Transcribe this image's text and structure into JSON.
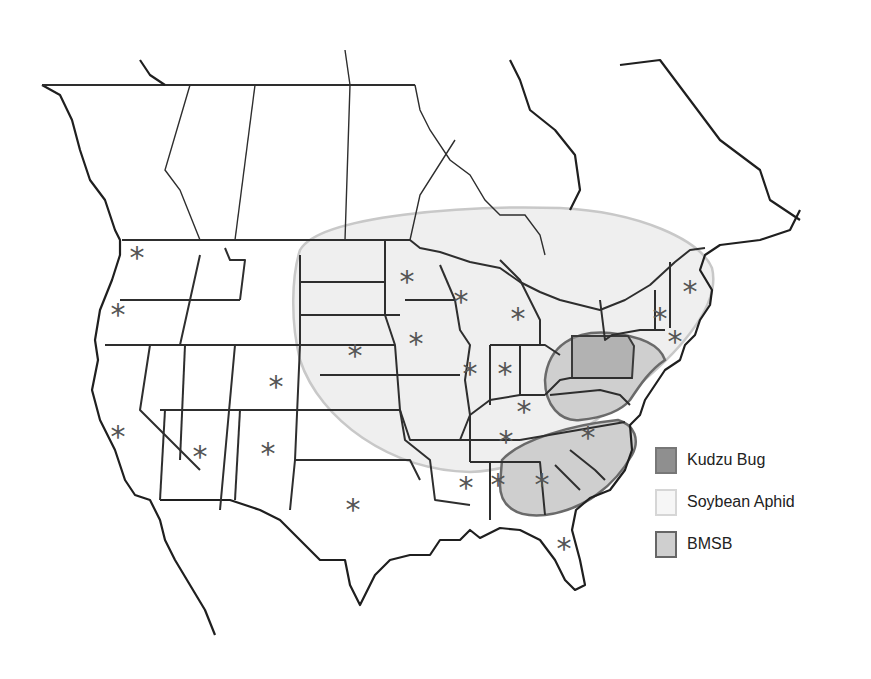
{
  "map": {
    "title": "",
    "region": "Continental United States and southern Canada",
    "colors": {
      "background": "#ffffff",
      "land": "#ffffff",
      "border": "#2e2e2e",
      "kudzu_bug": "#9a9a9a",
      "soybean_aphid": "#efefef",
      "soybean_aphid_outline": "#c8c8c8",
      "bmsb": "#cfcfcf",
      "bmsb_outline": "#6a6a6a",
      "asterisk": "#555555"
    },
    "marker_symbol": "*",
    "markers": [
      {
        "state": "Washington",
        "x": 137,
        "y": 256
      },
      {
        "state": "Oregon",
        "x": 118,
        "y": 313
      },
      {
        "state": "California",
        "x": 118,
        "y": 435
      },
      {
        "state": "Colorado",
        "x": 276,
        "y": 385
      },
      {
        "state": "Arizona",
        "x": 200,
        "y": 455
      },
      {
        "state": "New Mexico",
        "x": 268,
        "y": 452
      },
      {
        "state": "Texas",
        "x": 353,
        "y": 508
      },
      {
        "state": "Minnesota",
        "x": 407,
        "y": 280
      },
      {
        "state": "Nebraska",
        "x": 355,
        "y": 354
      },
      {
        "state": "Iowa",
        "x": 416,
        "y": 342
      },
      {
        "state": "Wisconsin",
        "x": 461,
        "y": 300
      },
      {
        "state": "Michigan",
        "x": 518,
        "y": 317
      },
      {
        "state": "Illinois",
        "x": 470,
        "y": 372
      },
      {
        "state": "Indiana",
        "x": 505,
        "y": 372
      },
      {
        "state": "Kentucky",
        "x": 524,
        "y": 410
      },
      {
        "state": "Tennessee",
        "x": 506,
        "y": 440
      },
      {
        "state": "Mississippi",
        "x": 466,
        "y": 486
      },
      {
        "state": "Alabama",
        "x": 498,
        "y": 483
      },
      {
        "state": "Georgia",
        "x": 542,
        "y": 483
      },
      {
        "state": "North Carolina",
        "x": 588,
        "y": 436
      },
      {
        "state": "Florida",
        "x": 564,
        "y": 547
      },
      {
        "state": "Vermont / New Hampshire",
        "x": 660,
        "y": 317
      },
      {
        "state": "Maine",
        "x": 690,
        "y": 290
      },
      {
        "state": "Connecticut / Rhode Island",
        "x": 675,
        "y": 340
      }
    ]
  },
  "legend": {
    "items": [
      {
        "label": "Kudzu Bug",
        "swatch": "kudzu_bug"
      },
      {
        "label": "Soybean Aphid",
        "swatch": "soybean_aphid"
      },
      {
        "label": "BMSB",
        "swatch": "bmsb"
      }
    ]
  }
}
